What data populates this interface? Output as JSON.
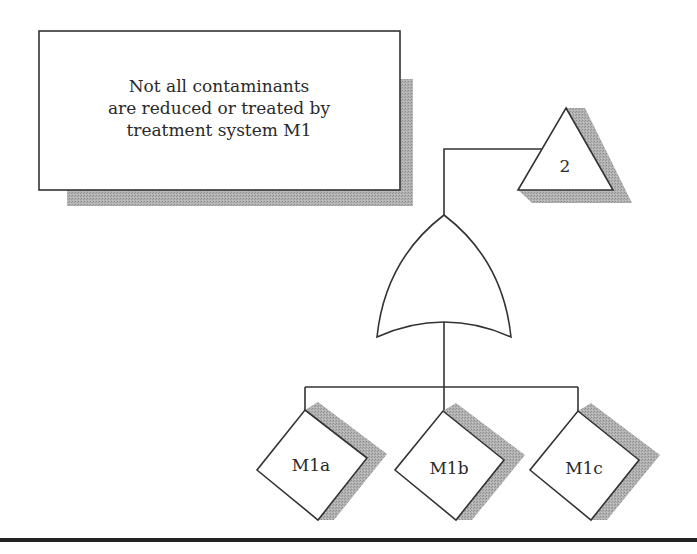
{
  "diagram": {
    "type": "fault-tree",
    "top_event": {
      "lines": [
        "Not all contaminants",
        "are reduced or treated by",
        "treatment system M1"
      ]
    },
    "gate": {
      "type": "OR"
    },
    "transfer": {
      "label": "2",
      "shape": "triangle"
    },
    "basic_events": [
      {
        "label": "M1a",
        "shape": "diamond"
      },
      {
        "label": "M1b",
        "shape": "diamond"
      },
      {
        "label": "M1c",
        "shape": "diamond"
      }
    ],
    "colors": {
      "stroke": "#333333",
      "shadow": "#a6a6a6",
      "fill": "#ffffff",
      "rule": "#222222"
    }
  }
}
